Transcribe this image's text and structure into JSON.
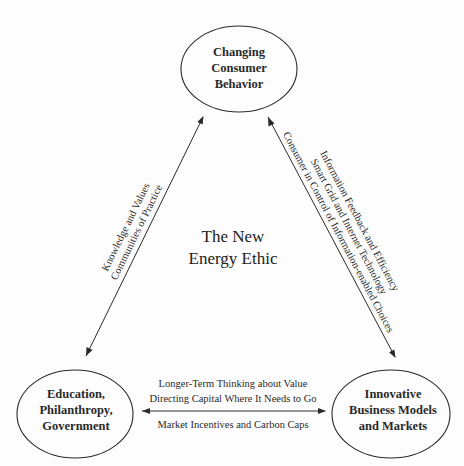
{
  "center": {
    "lines": [
      "The New",
      "Energy Ethic"
    ]
  },
  "nodes": {
    "top": {
      "lines": [
        "Changing",
        "Consumer",
        "Behavior"
      ]
    },
    "left": {
      "lines": [
        "Education,",
        "Philanthropy,",
        "Government"
      ]
    },
    "right": {
      "lines": [
        "Innovative",
        "Business Models",
        "and Markets"
      ]
    }
  },
  "edges": {
    "left": {
      "from": "Education, Philanthropy, Government",
      "to": "Changing Consumer Behavior",
      "bidirectional": true,
      "labels": [
        "Knowledge and Values",
        "Communities of Practice"
      ]
    },
    "right": {
      "from": "Changing Consumer Behavior",
      "to": "Innovative Business Models and Markets",
      "bidirectional": true,
      "labels": [
        "Information Feedback and Efficiency",
        "Smart Grid and Internet Technology",
        "Consumer in Control of Information-enabled Choices"
      ]
    },
    "bottom": {
      "from": "Education, Philanthropy, Government",
      "to": "Innovative Business Models and Markets",
      "bidirectional": true,
      "labels_above": [
        "Longer-Term Thinking about Value",
        "Directing Capital Where It Needs to Go"
      ],
      "labels_below": [
        "Market Incentives and Carbon Caps"
      ]
    }
  },
  "colors": {
    "stroke": "#2a2a2a",
    "text": "#2a2a2a",
    "background": "#fdfdfd"
  }
}
